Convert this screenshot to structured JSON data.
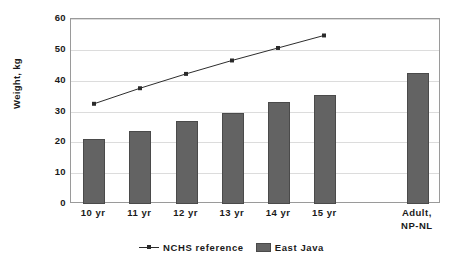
{
  "chart_data": {
    "type": "bar",
    "title": "",
    "xlabel": "",
    "ylabel": "Weight, kg",
    "ylim": [
      0,
      60
    ],
    "yticks": [
      0,
      10,
      20,
      30,
      40,
      50,
      60
    ],
    "ytick_labels": [
      "0",
      "10",
      "20",
      "30",
      "40",
      "50",
      "60"
    ],
    "grid": true,
    "legend_position": "bottom-center",
    "categories": [
      "10 yr",
      "11 yr",
      "12 yr",
      "13 yr",
      "14 yr",
      "15 yr",
      "Adult,\nNP-NL"
    ],
    "series": [
      {
        "name": "East Java",
        "type": "bar",
        "color": "#636363",
        "values": [
          21.0,
          23.8,
          26.9,
          29.5,
          33.2,
          35.3,
          42.4
        ]
      },
      {
        "name": "NCHS reference",
        "type": "line",
        "color": "#2a2a2a",
        "marker": "square",
        "values": [
          32.2,
          37.3,
          42.0,
          46.4,
          50.5,
          54.6,
          null
        ]
      }
    ]
  },
  "axes": {
    "y_title": "Weight, kg"
  },
  "legend": {
    "entries": [
      {
        "label": "NCHS reference",
        "marker": "line-with-square-marker",
        "color": "#2a2a2a"
      },
      {
        "label": "East Java",
        "marker": "filled-square-swatch",
        "color": "#636363"
      }
    ]
  }
}
